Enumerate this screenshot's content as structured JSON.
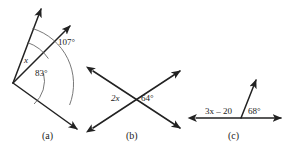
{
  "figure": {
    "background_color": "#ffffff",
    "stroke_color": "#222222",
    "panels": [
      {
        "id": "a",
        "caption": "(a)",
        "type": "three-rays-from-vertex",
        "labels": {
          "variable": "x",
          "inner_angle": "83°",
          "outer_angle": "107°"
        }
      },
      {
        "id": "b",
        "caption": "(b)",
        "type": "two-crossing-lines",
        "labels": {
          "left_angle": "2x",
          "right_angle": "64°"
        }
      },
      {
        "id": "c",
        "caption": "(c)",
        "type": "ray-on-line",
        "labels": {
          "left_angle": "3x – 20",
          "right_angle": "68°"
        }
      }
    ]
  }
}
